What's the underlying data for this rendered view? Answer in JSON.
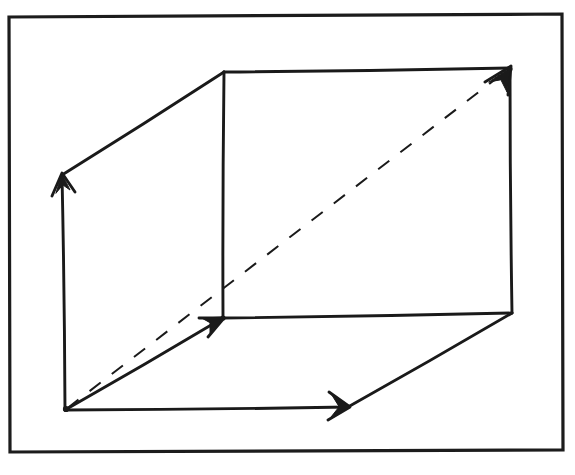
{
  "document": {
    "title": "Vector Parallelepiped Diagram",
    "background_color": "#ffffff",
    "ink_color": "#1a1a1a",
    "width": 575,
    "height": 475
  },
  "frame": {
    "name": "outer-border",
    "x": 8,
    "y": 15,
    "width": 554,
    "height": 437,
    "stroke_width": 3.2,
    "color": "#1c1c1c"
  },
  "figure": {
    "vertices": {
      "origin": {
        "label": "O",
        "x": 65,
        "y": 410
      },
      "up": {
        "label": "A",
        "x": 62,
        "y": 175
      },
      "depth": {
        "label": "B",
        "x": 223,
        "y": 318
      },
      "right": {
        "label": "C",
        "x": 348,
        "y": 407
      },
      "top_front_left": {
        "label": "D",
        "x": 224,
        "y": 72
      },
      "top_back_right": {
        "label": "E",
        "x": 510,
        "y": 68
      },
      "bottom_back_right": {
        "label": "F",
        "x": 512,
        "y": 313
      }
    },
    "edges": [
      {
        "name": "vector-up",
        "from": "origin",
        "to": "up",
        "style": "solid",
        "arrow": "end"
      },
      {
        "name": "vector-depth",
        "from": "origin",
        "to": "depth",
        "style": "solid",
        "arrow": "end"
      },
      {
        "name": "vector-right",
        "from": "origin",
        "to": "right",
        "style": "solid",
        "arrow": "end"
      },
      {
        "name": "edge-up-to-top-front-left",
        "from": "up",
        "to": "top_front_left",
        "style": "solid",
        "arrow": "none"
      },
      {
        "name": "edge-top-front-left-to-top-back-right",
        "from": "top_front_left",
        "to": "top_back_right",
        "style": "solid",
        "arrow": "none"
      },
      {
        "name": "edge-top-front-left-to-depth",
        "from": "top_front_left",
        "to": "depth",
        "style": "solid",
        "arrow": "none"
      },
      {
        "name": "edge-depth-to-bottom-back-right",
        "from": "depth",
        "to": "bottom_back_right",
        "style": "solid",
        "arrow": "none"
      },
      {
        "name": "edge-top-back-right-to-bottom-back-right",
        "from": "top_back_right",
        "to": "bottom_back_right",
        "style": "solid",
        "arrow": "none"
      },
      {
        "name": "edge-right-to-bottom-back-right",
        "from": "right",
        "to": "bottom_back_right",
        "style": "solid",
        "arrow": "none"
      }
    ],
    "diagonal": {
      "name": "space-diagonal-vector",
      "from": "origin",
      "to": "top_back_right",
      "style": "dashed",
      "arrow": "end",
      "dash_pattern": "14 14",
      "stroke_width": 2.0
    },
    "arrowheads": [
      {
        "name": "arrowhead-up",
        "at_x": 62,
        "at_y": 175,
        "points_to": "up"
      },
      {
        "name": "arrowhead-depth",
        "at_x": 223,
        "at_y": 318,
        "points_to": "depth"
      },
      {
        "name": "arrowhead-right",
        "at_x": 348,
        "at_y": 407,
        "points_to": "right"
      },
      {
        "name": "arrowhead-diagonal",
        "at_x": 510,
        "at_y": 68,
        "points_to": "top_back_right"
      }
    ],
    "stroke_width_solid": 2.9
  }
}
